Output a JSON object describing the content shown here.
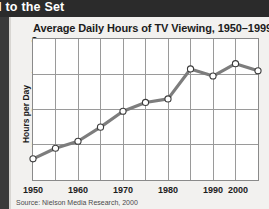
{
  "article": {
    "headline_fragment": "d to the Set"
  },
  "figure": {
    "source_note": "Source: Nielson Media Research, 2000"
  },
  "chart_data": {
    "type": "line",
    "title": "Average Daily Hours of TV Viewing, 1950–1999",
    "xlabel": "",
    "ylabel": "Hours per Day",
    "x": [
      1950,
      1955,
      1960,
      1965,
      1970,
      1975,
      1980,
      1985,
      1990,
      1995,
      2000
    ],
    "values": [
      4.6,
      4.9,
      5.1,
      5.5,
      5.95,
      6.2,
      6.3,
      7.15,
      6.95,
      7.3,
      7.1
    ],
    "xlim": [
      1950,
      2000
    ],
    "ylim": [
      4,
      8
    ],
    "xticks": [
      1950,
      1960,
      1970,
      1980,
      1990,
      2000
    ],
    "xticklabels": [
      "1950",
      "1960",
      "1970",
      "1980",
      "1990",
      "2000"
    ],
    "yticks": [
      5,
      6,
      7,
      8
    ],
    "yticklabels": [
      "5",
      "6",
      "7",
      "8"
    ],
    "grid": true,
    "legend": null,
    "series_color": "#7d7d7d",
    "marker_face_color": "#ffffff",
    "marker_edge_color": "#3c3c3c",
    "grid_color": "#9a9a9a",
    "plot_bg": "#ffffff",
    "figure_bg": "#f2f1ef",
    "header_bg": "#2b2b2b"
  }
}
